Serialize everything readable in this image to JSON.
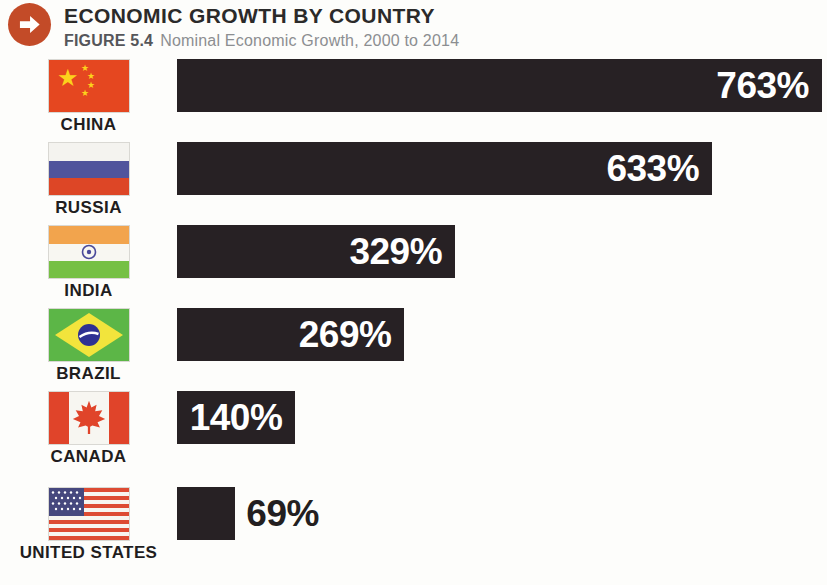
{
  "header": {
    "title": "ECONOMIC GROWTH BY COUNTRY",
    "figure_label": "FIGURE 5.4",
    "figure_caption": "Nominal Economic Growth, 2000 to 2014"
  },
  "chart_data": {
    "type": "bar",
    "orientation": "horizontal",
    "title": "ECONOMIC GROWTH BY COUNTRY",
    "subtitle": "FIGURE 5.4 Nominal Economic Growth, 2000 to 2014",
    "unit": "%",
    "xlim": [
      0,
      763
    ],
    "grid": false,
    "legend": "none",
    "categories": [
      "CHINA",
      "RUSSIA",
      "INDIA",
      "BRAZIL",
      "CANADA",
      "UNITED STATES"
    ],
    "values": [
      763,
      633,
      329,
      269,
      140,
      69
    ],
    "labels": [
      "763%",
      "633%",
      "329%",
      "269%",
      "140%",
      "69%"
    ],
    "label_inside": [
      true,
      true,
      true,
      true,
      true,
      false
    ]
  },
  "icons": {
    "header_badge": "arrow-right-circle-icon",
    "flags": [
      "china-flag",
      "russia-flag",
      "india-flag",
      "brazil-flag",
      "canada-flag",
      "united-states-flag"
    ]
  },
  "colors": {
    "accent_orange": "#c34b28",
    "bar": "#272124",
    "bar_value_text": "#ffffff",
    "outside_value_text": "#231f20",
    "title_text": "#2b2a2a",
    "figure_label_text": "#55565a",
    "caption_text": "#8c8e91"
  }
}
